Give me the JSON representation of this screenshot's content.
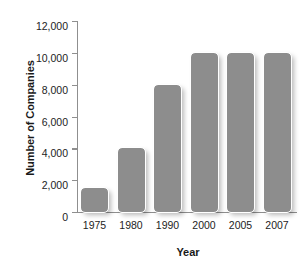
{
  "chart_data": {
    "type": "bar",
    "title": "",
    "xlabel": "Year",
    "ylabel": "Number of Companies",
    "categories": [
      "1975",
      "1980",
      "1990",
      "2000",
      "2005",
      "2007"
    ],
    "values": [
      1500,
      4000,
      8000,
      10000,
      10000,
      10000
    ],
    "ylim": [
      0,
      12000
    ],
    "ytick_labels": [
      "0",
      "2,000",
      "4,000",
      "6,000",
      "8,000",
      "10,000",
      "12,000"
    ],
    "ytick_values": [
      0,
      2000,
      4000,
      6000,
      8000,
      10000,
      12000
    ],
    "grid": false,
    "legend": false,
    "bar_color": "#8d8d8d",
    "axis_color": "#8f8f8f",
    "text_color": "#1d1d1d"
  }
}
